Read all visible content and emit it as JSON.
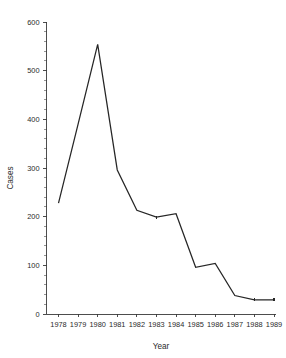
{
  "chart_data": {
    "type": "line",
    "title": "",
    "xlabel": "Year",
    "ylabel": "Cases",
    "x": [
      1978,
      1979,
      1980,
      1981,
      1982,
      1983,
      1984,
      1985,
      1986,
      1987,
      1988,
      1989
    ],
    "categories": [
      "1978",
      "1979",
      "1980",
      "1981",
      "1982",
      "1983",
      "1984",
      "1985",
      "1986",
      "1987",
      "1988",
      "1989"
    ],
    "values": [
      228,
      390,
      554,
      296,
      213,
      199,
      206,
      96,
      104,
      38,
      29,
      29
    ],
    "series": [
      {
        "name": "Cases",
        "values": [
          228,
          390,
          554,
          296,
          213,
          199,
          206,
          96,
          104,
          38,
          29,
          29
        ]
      }
    ],
    "xlim": [
      1977.6,
      1989.4
    ],
    "ylim": [
      0,
      600
    ],
    "ytick_labels": [
      "0",
      "100",
      "200",
      "300",
      "400",
      "500",
      "600"
    ],
    "ytick_values": [
      0,
      100,
      200,
      300,
      400,
      500,
      600
    ],
    "y_minor_step": 20,
    "xtick_labels": [
      "1978",
      "1979",
      "1980",
      "1981",
      "1982",
      "1983",
      "1984",
      "1985",
      "1986",
      "1987",
      "1988",
      "1989"
    ],
    "grid": false,
    "legend": false,
    "legend_position": "none",
    "line_color": "#262626",
    "axis_color": "#3a3a3a",
    "background_color": "#ffffff"
  }
}
